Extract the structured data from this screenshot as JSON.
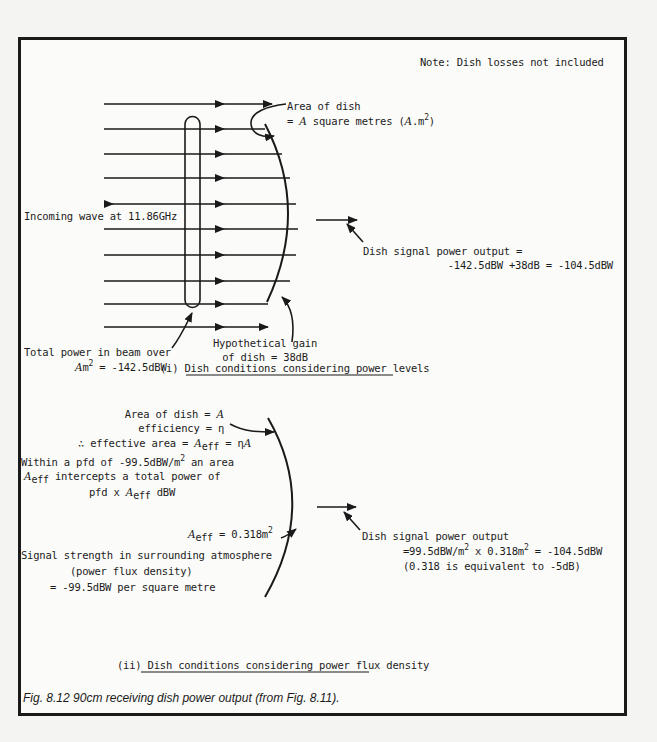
{
  "note": "Note: Dish losses not included",
  "part1": {
    "area_label_line1": "Area of dish",
    "area_label_line2_prefix": "= ",
    "area_symbol": "A",
    "area_label_line2_mid": " square metres (",
    "area_unit_symbol": "A",
    "area_unit_suffix": ".m",
    "area_unit_exp": "2",
    "area_label_line2_end": ")",
    "incoming_wave": "Incoming wave at 11.86GHz",
    "output_label_line1": "Dish signal power output =",
    "output_label_line2": "-142.5dBW +38dB = -104.5dBW",
    "total_power_line1": "Total power in beam over",
    "total_power_symbol": "A",
    "total_power_unit": "m",
    "total_power_exp": "2",
    "total_power_value": " = -142.5dBW",
    "gain_line1": "Hypothetical gain",
    "gain_line2": "of dish = 38dB",
    "title_prefix": "(i) ",
    "title": "Dish conditions considering power levels"
  },
  "part2": {
    "area_line_prefix": "Area of dish = ",
    "area_symbol": "A",
    "efficiency_line": "efficiency = η",
    "effective_prefix": "∴ effective area = ",
    "aeff_symbol": "A",
    "aeff_sub": "eff",
    "effective_suffix": " = η",
    "effective_A": "A",
    "pfd_line1_a": "Within a pfd of -99.5dBW/m",
    "pfd_line1_exp": "2",
    "pfd_line1_b": " an area",
    "pfd_line2_symbol": "A",
    "pfd_line2_sub": "eff",
    "pfd_line2_text": " intercepts a total power of",
    "pfd_line3_a": "pfd x ",
    "pfd_line3_symbol": "A",
    "pfd_line3_sub": "eff",
    "pfd_line3_unit": " dBW",
    "aeff_value_symbol": "A",
    "aeff_value_sub": "eff",
    "aeff_value": " = 0.318m",
    "aeff_value_exp": "2",
    "signal_line1": "Signal strength in surrounding atmosphere",
    "signal_line2": "(power flux density)",
    "signal_line3": "= -99.5dBW per square metre",
    "output_line1": "Dish signal power output",
    "output_line2_a": "=99.5dBW/m",
    "output_line2_exp1": "2",
    "output_line2_b": " x 0.318m",
    "output_line2_exp2": "2",
    "output_line2_c": " = -104.5dBW",
    "output_line3": "(0.318 is equivalent to -5dB)",
    "title_prefix": "(ii) ",
    "title": "Dish conditions considering power flux density"
  },
  "caption": "Fig. 8.12  90cm receiving dish power output (from Fig. 8.11)."
}
